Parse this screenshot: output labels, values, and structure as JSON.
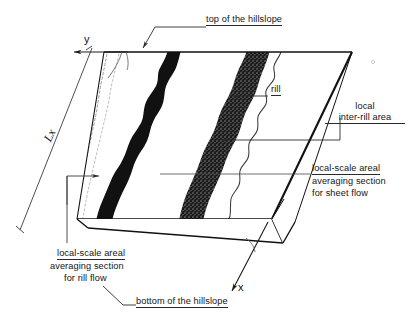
{
  "figure": {
    "title_implied": "Hillslope with rills and inter-rill areas",
    "background_color": "#ffffff",
    "ink_color": "#141414"
  },
  "axes": {
    "y_label": "y",
    "x_label": "x"
  },
  "dimension": {
    "lx_label": "Lx"
  },
  "annotations": {
    "top_of_hillslope": "top of the hillslope",
    "bottom_of_hillslope": "bottom of the hillslope",
    "rill": "rill",
    "inter_rill_line1": "local",
    "inter_rill_line2": "inter-rill area",
    "sheet_flow_line1": "local-scale areal",
    "sheet_flow_line2": "averaging section",
    "sheet_flow_line3": "for sheet flow",
    "rill_flow_line1": "local-scale areal",
    "rill_flow_line2": "averaging section",
    "rill_flow_line3": "for rill flow"
  },
  "features": {
    "rill_solid_name": "solid-black-rill-band",
    "rill_stippled_name": "stippled-rill-band",
    "rill_dotted_name": "faint-dotted-rill-outline",
    "interrill_name": "white-inter-rill-surface"
  }
}
